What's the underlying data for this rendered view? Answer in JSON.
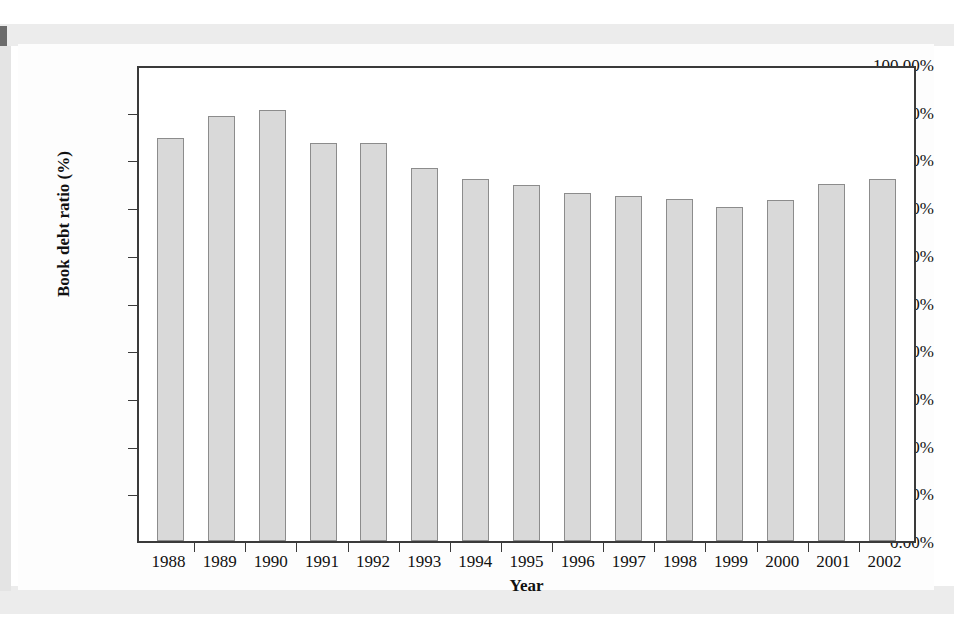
{
  "chart_data": {
    "type": "bar",
    "title": "",
    "xlabel": "Year",
    "ylabel": "Book debt ratio (%)",
    "categories": [
      "1988",
      "1989",
      "1990",
      "1991",
      "1992",
      "1993",
      "1994",
      "1995",
      "1996",
      "1997",
      "1998",
      "1999",
      "2000",
      "2001",
      "2002"
    ],
    "values": [
      84.5,
      89.0,
      90.3,
      83.5,
      83.4,
      78.2,
      75.8,
      74.7,
      73.0,
      72.4,
      71.6,
      70.0,
      71.5,
      74.8,
      75.8
    ],
    "ylim": [
      0,
      100
    ],
    "ytick_values": [
      100,
      90,
      80,
      70,
      60,
      50,
      40,
      30,
      20,
      10,
      0
    ],
    "ytick_labels": [
      "100.00%",
      "90.00%",
      "80.00%",
      "70.00%",
      "60.00%",
      "50.00%",
      "40.00%",
      "30.00%",
      "20.00%",
      "10.00%",
      "0.00%"
    ],
    "grid": false,
    "legend": false,
    "bar_fill_color": "#d9d9d9",
    "bar_edge_color": "#8c8c8c",
    "axis_color": "#3a3a3a"
  },
  "page": {
    "background_color": "#ffffff",
    "scan_band_color": "#ececec",
    "ghost_lines": [
      "ceiving a 30% to 40% equity",
      "hance in generating these",
      "enable costs.",
      "e and resolution of financial distress",
      "onal Monetary Fund",
      "anagement and business restructuring among",
      "n the chaebol - Korea's large business conglomerates",
      "and manufacturing process.",
      "shows the average book value debt-to-assets ratio",
      "Korea"
    ]
  }
}
